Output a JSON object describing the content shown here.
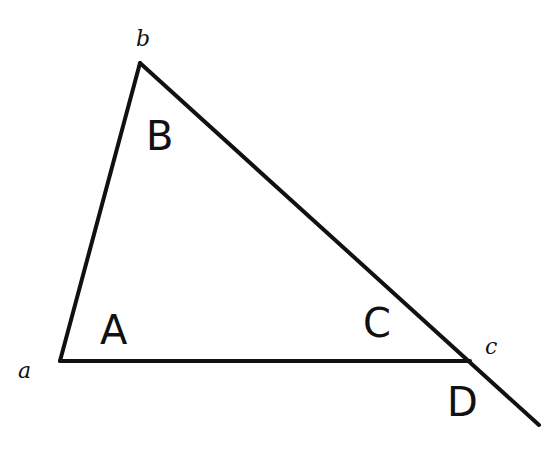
{
  "diagram": {
    "type": "triangle-with-exterior-angle",
    "stroke_color": "#111111",
    "background": "#ffffff",
    "vertices": {
      "a": {
        "label": "a",
        "x": 60,
        "y": 361
      },
      "b": {
        "label": "b",
        "x": 140,
        "y": 63
      },
      "c": {
        "label": "c",
        "x": 470,
        "y": 361
      }
    },
    "extension_end": {
      "x": 539,
      "y": 425
    },
    "vertex_labels": {
      "a": "a",
      "b": "b",
      "c": "c"
    },
    "angle_labels": {
      "A": "A",
      "B": "B",
      "C": "C",
      "D": "D"
    }
  }
}
